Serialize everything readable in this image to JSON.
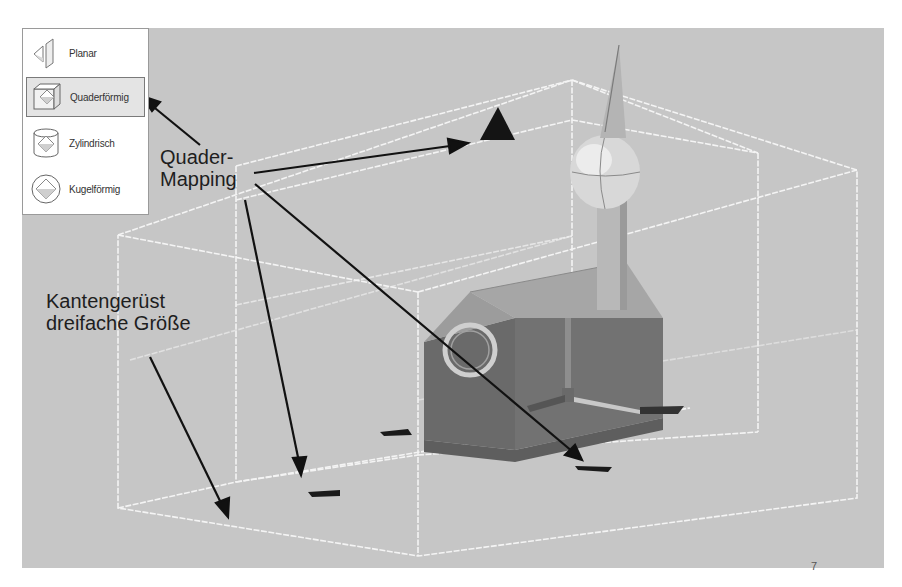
{
  "projection_menu": {
    "items": [
      {
        "label": "Planar",
        "icon": "planar-projection-icon",
        "selected": false
      },
      {
        "label": "Quaderförmig",
        "icon": "box-projection-icon",
        "selected": true
      },
      {
        "label": "Zylindrisch",
        "icon": "cylinder-projection-icon",
        "selected": false
      },
      {
        "label": "Kugelförmig",
        "icon": "sphere-projection-icon",
        "selected": false
      }
    ]
  },
  "annotations": {
    "box_mapping_line1": "Quader-",
    "box_mapping_line2": "Mapping",
    "wireframe_line1": "Kantengerüst",
    "wireframe_line2": "dreifache Größe"
  },
  "page_number": "7",
  "colors": {
    "viewport_bg": "#c6c6c6",
    "wireframe": "#f2f2f2",
    "arrow": "#111111",
    "building_wall": "#6e6e6e",
    "roof": "#a8a8a8"
  }
}
